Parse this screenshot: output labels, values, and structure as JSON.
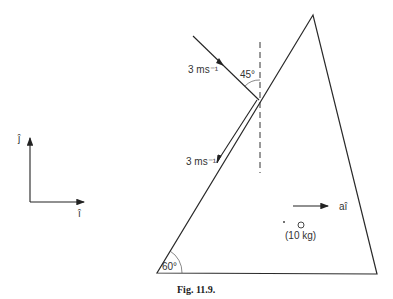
{
  "figure": {
    "caption": "Fig. 11.9.",
    "incoming_speed": "3 ms⁻¹",
    "outgoing_speed": "3 ms⁻¹",
    "incidence_angle": "45°",
    "wedge_angle": "60°",
    "mass_label": "(10 kg)",
    "acceleration_label": "aî",
    "axis_i_label": "î",
    "axis_j_label": "ĵ",
    "stroke_color": "#2a2a2a"
  }
}
